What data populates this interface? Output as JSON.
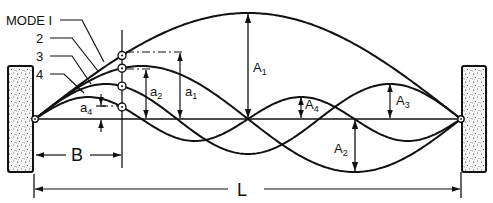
{
  "diagram": {
    "colors": {
      "ink": "#111111",
      "background": "#ffffff",
      "support_fill": "#f4f4f4"
    },
    "mode_labels": [
      {
        "id": "mode1",
        "text": "MODE I"
      },
      {
        "id": "mode2",
        "text": "2"
      },
      {
        "id": "mode3",
        "text": "3"
      },
      {
        "id": "mode4",
        "text": "4"
      }
    ],
    "amplitude_labels": {
      "A1": {
        "main": "A",
        "sub": "1"
      },
      "A2": {
        "main": "A",
        "sub": "2"
      },
      "A3": {
        "main": "A",
        "sub": "3"
      },
      "A4": {
        "main": "A",
        "sub": "4"
      }
    },
    "point_amplitude_labels": {
      "a1": {
        "main": "a",
        "sub": "1"
      },
      "a2": {
        "main": "a",
        "sub": "2"
      },
      "a4": {
        "main": "a",
        "sub": "4"
      }
    },
    "dimensions": {
      "B": "B",
      "L": "L"
    },
    "geometry": {
      "left_pin": [
        35,
        119
      ],
      "right_pin": [
        461,
        119
      ],
      "baseline_y": 119,
      "measure_x": 122,
      "mode_amplitudes_px": [
        106,
        53,
        35,
        22
      ]
    }
  }
}
